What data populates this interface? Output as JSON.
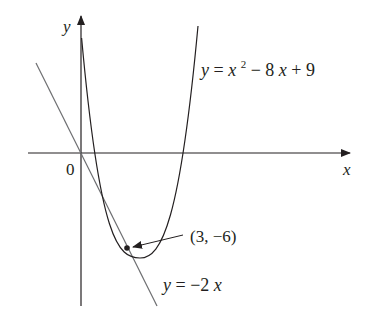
{
  "diagram": {
    "axes": {
      "x_label": "x",
      "y_label": "y",
      "origin_label": "0"
    },
    "curves": [
      {
        "name": "parabola",
        "equation": "y = x² − 8x + 9",
        "label_y": "y",
        "label_eq": "=",
        "label_x": "x",
        "label_sup": "2",
        "label_rest": " − 8",
        "label_x2": "x",
        "label_tail": " + 9"
      },
      {
        "name": "tangent-line",
        "equation": "y = −2x",
        "label_y": "y",
        "label_eq": " = −2",
        "label_x": "x"
      }
    ],
    "point": {
      "label": "(3, −6)",
      "x": 3,
      "y": -6
    },
    "colors": {
      "ink": "#231f20",
      "tangent": "#6d6e71"
    }
  }
}
